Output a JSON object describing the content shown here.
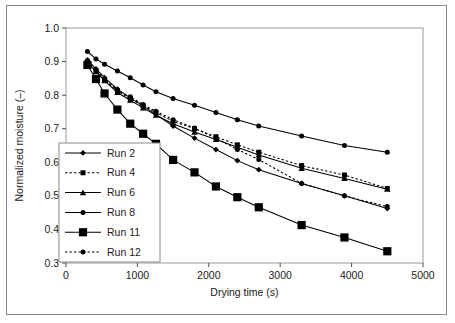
{
  "chart_data": {
    "type": "line",
    "title": "",
    "xlabel": "Drying time (s)",
    "ylabel": "Normalized moisture (–)",
    "xlim": [
      0,
      5000
    ],
    "ylim": [
      0.3,
      1.0
    ],
    "xticks": [
      "0",
      "1000",
      "2000",
      "3000",
      "4000",
      "5000"
    ],
    "xtick_values": [
      0,
      1000,
      2000,
      3000,
      4000,
      5000
    ],
    "yticks": [
      "0.3",
      "0.4",
      "0.5",
      "0.6",
      "0.7",
      "0.8",
      "0.9",
      "1.0"
    ],
    "ytick_values": [
      0.3,
      0.4,
      0.5,
      0.6,
      0.7,
      0.8,
      0.9,
      1.0
    ],
    "grid": false,
    "legend_position": "inner-left",
    "series": [
      {
        "name": "Run 2",
        "marker": "diamond",
        "linestyle": "solid",
        "color": "#000000",
        "x": [
          300,
          420,
          540,
          720,
          900,
          1080,
          1260,
          1500,
          1800,
          2100,
          2400,
          2700,
          3300,
          3900,
          4500
        ],
        "y": [
          0.905,
          0.878,
          0.852,
          0.818,
          0.792,
          0.768,
          0.742,
          0.708,
          0.672,
          0.638,
          0.605,
          0.578,
          0.537,
          0.5,
          0.462
        ]
      },
      {
        "name": "Run 4",
        "marker": "square",
        "linestyle": "dotted",
        "color": "#000000",
        "x": [
          300,
          420,
          540,
          720,
          900,
          1080,
          1260,
          1500,
          1800,
          2100,
          2400,
          2700,
          3300,
          3900,
          4500
        ],
        "y": [
          0.9,
          0.872,
          0.845,
          0.812,
          0.79,
          0.768,
          0.748,
          0.722,
          0.7,
          0.676,
          0.652,
          0.63,
          0.59,
          0.562,
          0.522
        ]
      },
      {
        "name": "Run 6",
        "marker": "triangle",
        "linestyle": "solid",
        "color": "#000000",
        "x": [
          300,
          420,
          540,
          720,
          900,
          1080,
          1260,
          1500,
          1800,
          2100,
          2400,
          2700,
          3300,
          3900,
          4500
        ],
        "y": [
          0.898,
          0.87,
          0.843,
          0.808,
          0.785,
          0.762,
          0.74,
          0.715,
          0.69,
          0.668,
          0.645,
          0.622,
          0.582,
          0.552,
          0.52
        ]
      },
      {
        "name": "Run 8",
        "marker": "circle",
        "linestyle": "solid",
        "color": "#000000",
        "x": [
          300,
          420,
          540,
          720,
          900,
          1080,
          1260,
          1500,
          1800,
          2100,
          2400,
          2700,
          3300,
          3900,
          4500
        ],
        "y": [
          0.93,
          0.908,
          0.892,
          0.872,
          0.852,
          0.83,
          0.81,
          0.79,
          0.77,
          0.748,
          0.727,
          0.708,
          0.678,
          0.65,
          0.63
        ]
      },
      {
        "name": "Run 11",
        "marker": "bigsquare",
        "linestyle": "solid",
        "color": "#000000",
        "x": [
          300,
          420,
          540,
          720,
          900,
          1080,
          1260,
          1500,
          1800,
          2100,
          2400,
          2700,
          3300,
          3900,
          4500
        ],
        "y": [
          0.89,
          0.848,
          0.805,
          0.757,
          0.715,
          0.685,
          0.655,
          0.607,
          0.57,
          0.528,
          0.496,
          0.466,
          0.413,
          0.376,
          0.335
        ]
      },
      {
        "name": "Run 12",
        "marker": "circle",
        "linestyle": "dotted",
        "color": "#000000",
        "x": [
          300,
          420,
          540,
          720,
          900,
          1080,
          1260,
          1500,
          1800,
          2100,
          2400,
          2700,
          3300,
          3900,
          4500
        ],
        "y": [
          0.902,
          0.875,
          0.848,
          0.815,
          0.795,
          0.772,
          0.752,
          0.727,
          0.702,
          0.672,
          0.638,
          0.608,
          0.537,
          0.5,
          0.468
        ]
      }
    ]
  },
  "legend": {
    "items": [
      {
        "label": "Run 2"
      },
      {
        "label": "Run 4"
      },
      {
        "label": "Run 6"
      },
      {
        "label": "Run 8"
      },
      {
        "label": "Run 11"
      },
      {
        "label": "Run 12"
      }
    ]
  },
  "axes": {
    "x_title": "Drying time (s)",
    "y_title": "Normalized moisture (–)"
  }
}
